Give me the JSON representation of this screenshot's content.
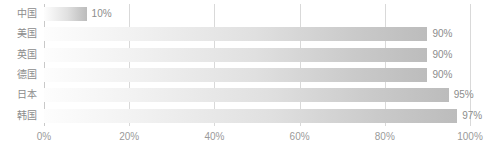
{
  "chart_data": {
    "type": "bar",
    "orientation": "horizontal",
    "title": "",
    "subtitle": "",
    "xlabel": "",
    "ylabel": "",
    "categories": [
      "中国",
      "美国",
      "英国",
      "德国",
      "日本",
      "韩国"
    ],
    "values": [
      10,
      90,
      90,
      90,
      95,
      97
    ],
    "value_labels": [
      "10%",
      "90%",
      "90%",
      "90%",
      "95%",
      "97%"
    ],
    "xlim": [
      0,
      100
    ],
    "xticks": [
      0,
      20,
      40,
      60,
      80,
      100
    ],
    "xtick_labels": [
      "0%",
      "20%",
      "40%",
      "60%",
      "80%",
      "100%"
    ],
    "grid": true,
    "grid_axis": "x",
    "legend": false,
    "legend_position": "none",
    "series": [
      {
        "name": "",
        "values": [
          10,
          90,
          90,
          90,
          95,
          97
        ]
      }
    ]
  },
  "style": {
    "background": "#ffffff",
    "bar_gradient_start": "#fdfdfd",
    "bar_gradient_end": "#bcbcbc",
    "gridline_color": "#d9d9d9",
    "axis_line_color": "#c9c9c9",
    "label_color": "#8c8c8c",
    "tick_label_color": "#9a9a9a"
  }
}
